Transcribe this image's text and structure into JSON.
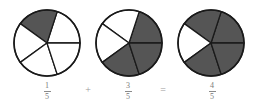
{
  "diagram": {
    "colors": {
      "shaded": "#555555",
      "unshaded": "#ffffff",
      "stroke": "#1a1a1a",
      "label": "#7a7a7a"
    },
    "slice_count": 5,
    "pies": [
      {
        "id": "pie-1",
        "cx": 47,
        "cy": 43,
        "r": 33,
        "shaded_slices": [
          1
        ],
        "fraction": {
          "numerator": "1",
          "denominator": "5"
        }
      },
      {
        "id": "pie-2",
        "cx": 129,
        "cy": 43,
        "r": 33,
        "shaded_slices": [
          0,
          3,
          4
        ],
        "fraction": {
          "numerator": "3",
          "denominator": "5"
        }
      },
      {
        "id": "pie-3",
        "cx": 211,
        "cy": 43,
        "r": 33,
        "shaded_slices": [
          0,
          1,
          3,
          4
        ],
        "fraction": {
          "numerator": "4",
          "denominator": "5"
        }
      }
    ],
    "operators": {
      "plus": "+",
      "equals": "="
    }
  }
}
